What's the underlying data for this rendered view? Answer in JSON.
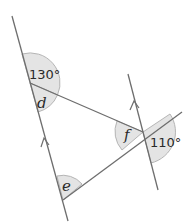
{
  "diagram": {
    "type": "parallel-lines-angles",
    "colors": {
      "line": "#6e6e6e",
      "sector_fill": "#e4e4e4",
      "sector_stroke": "#b5b5b5",
      "text": "#2a2a2a"
    },
    "angles": {
      "angle_130": "130°",
      "angle_110": "110°",
      "angle_d": "d",
      "angle_e": "e",
      "angle_f": "f"
    },
    "parallel_markers": [
      "arrow-up",
      "arrow-up"
    ]
  }
}
